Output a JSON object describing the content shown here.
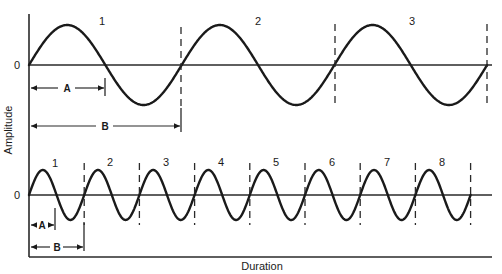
{
  "figure": {
    "y_axis_label": "Amplitude",
    "x_axis_label": "Duration",
    "top_panel": {
      "zero_label": "0",
      "cycle_labels": [
        "1",
        "2",
        "3"
      ],
      "dimension_labels": {
        "a": "A",
        "b": "B"
      }
    },
    "bottom_panel": {
      "zero_label": "0",
      "cycle_labels": [
        "1",
        "2",
        "3",
        "4",
        "5",
        "6",
        "7",
        "8"
      ],
      "dimension_labels": {
        "a": "A",
        "b": "B"
      }
    }
  },
  "chart_data": {
    "type": "line",
    "title": "",
    "xlabel": "Duration",
    "ylabel": "Amplitude",
    "series": [
      {
        "name": "Low frequency wave (top)",
        "waveform": "sine",
        "cycles": 3,
        "cycle_labels": [
          "1",
          "2",
          "3"
        ],
        "annotations": {
          "A": "half period (zero crossing to zero crossing)",
          "B": "one full period"
        }
      },
      {
        "name": "High frequency wave (bottom)",
        "waveform": "sine",
        "cycles": 8,
        "cycle_labels": [
          "1",
          "2",
          "3",
          "4",
          "5",
          "6",
          "7",
          "8"
        ],
        "annotations": {
          "A": "half period",
          "B": "one full period"
        }
      }
    ],
    "grid": false,
    "legend": "none"
  }
}
